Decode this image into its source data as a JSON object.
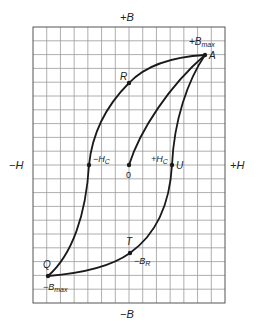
{
  "diagram": {
    "axes": {
      "top": "+B",
      "bottom": "−B",
      "left": "−H",
      "right": "+H"
    },
    "grid": {
      "columns": 14,
      "rows": 20,
      "line_color": "#9a9a9a",
      "border_color": "#555555"
    },
    "curve_color": "#1a1a1a",
    "points": {
      "A": {
        "label": "A",
        "annotation": "+B",
        "annotation_sub": "max"
      },
      "R": {
        "label": "R"
      },
      "neg_hc": {
        "label": "−H",
        "sub": "C"
      },
      "origin": {
        "label": "0"
      },
      "pos_hc": {
        "label": "+H",
        "sub": "C"
      },
      "U": {
        "label": "U"
      },
      "T": {
        "label": "T",
        "annotation": "−B",
        "annotation_sub": "R"
      },
      "Q": {
        "label": "Q",
        "annotation": "−B",
        "annotation_sub": "max"
      }
    }
  }
}
